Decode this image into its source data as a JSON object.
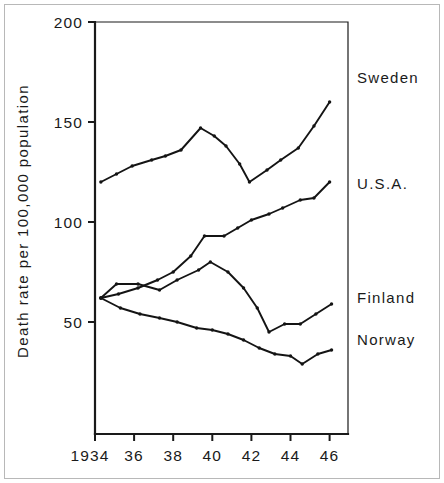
{
  "chart_data": {
    "type": "line",
    "title": "",
    "subtitle": "",
    "xlabel": "",
    "ylabel": "Death rate per 100,000 population",
    "xlim": [
      1934,
      1947
    ],
    "ylim": [
      0,
      200
    ],
    "grid": false,
    "legend_position": "right-inline",
    "x_tick_labels": [
      "1934",
      "36",
      "38",
      "40",
      "42",
      "44",
      "46"
    ],
    "x_tick_values": [
      1934,
      1936,
      1938,
      1940,
      1942,
      1944,
      1946
    ],
    "y_tick_labels": [
      "200",
      "150",
      "100",
      "50"
    ],
    "y_tick_values": [
      200,
      150,
      100,
      50
    ],
    "series": [
      {
        "name": "Sweden",
        "label": "Sweden",
        "color": "#141414",
        "label_y_value": 172,
        "x": [
          1934.3,
          1935.1,
          1935.9,
          1936.9,
          1937.6,
          1938.4,
          1939.4,
          1940.1,
          1940.7,
          1941.4,
          1941.9,
          1942.8,
          1943.5,
          1944.4,
          1945.2,
          1946.0
        ],
        "values": [
          120,
          124,
          128,
          131,
          133,
          136,
          147,
          143,
          138,
          129,
          120,
          126,
          131,
          137,
          148,
          160
        ]
      },
      {
        "name": "U.S.A.",
        "label": "U.S.A.",
        "color": "#141414",
        "label_y_value": 119,
        "x": [
          1934.3,
          1935.2,
          1936.2,
          1937.2,
          1938.0,
          1938.9,
          1939.6,
          1940.6,
          1941.3,
          1942.0,
          1942.9,
          1943.6,
          1944.5,
          1945.2,
          1946.0
        ],
        "values": [
          62,
          64,
          67,
          71,
          75,
          83,
          93,
          93,
          97,
          101,
          104,
          107,
          111,
          112,
          120
        ]
      },
      {
        "name": "Finland",
        "label": "Finland",
        "color": "#141414",
        "label_y_value": 62,
        "x": [
          1934.3,
          1935.1,
          1936.2,
          1937.3,
          1938.2,
          1939.3,
          1939.9,
          1940.8,
          1941.6,
          1942.3,
          1942.9,
          1943.7,
          1944.5,
          1945.3,
          1946.1
        ],
        "values": [
          62,
          69,
          69,
          66,
          71,
          76,
          80,
          75,
          67,
          57,
          45,
          49,
          49,
          54,
          59
        ]
      },
      {
        "name": "Norway",
        "label": "Norway",
        "color": "#141414",
        "label_y_value": 41,
        "x": [
          1934.3,
          1935.3,
          1936.3,
          1937.3,
          1938.2,
          1939.2,
          1940.0,
          1940.8,
          1941.6,
          1942.4,
          1943.2,
          1944.0,
          1944.6,
          1945.4,
          1946.1
        ],
        "values": [
          62,
          57,
          54,
          52,
          50,
          47,
          46,
          44,
          41,
          37,
          34,
          33,
          29,
          34,
          36
        ]
      }
    ]
  },
  "figure": {
    "background_color": "#ffffff",
    "ink_color": "#141414",
    "border_color": "#b8b8b8"
  }
}
